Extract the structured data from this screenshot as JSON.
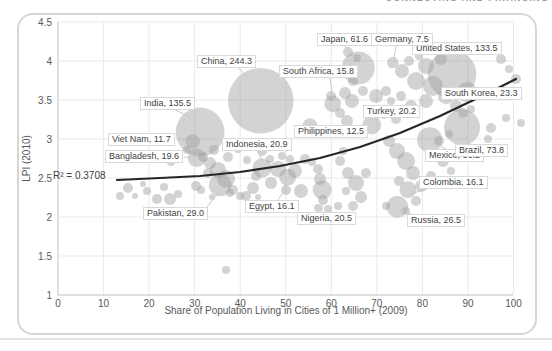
{
  "page": {
    "header_fragment": "CONNECTING AND FINANCING"
  },
  "chart_data": {
    "type": "scatter",
    "bubble": true,
    "title": "",
    "xlabel": "Share of Population Living in Cities of 1 Million+ (2009)",
    "ylabel": "LPI (2010)",
    "xlim": [
      0,
      100
    ],
    "ylim": [
      1,
      4.5
    ],
    "x_ticks": [
      0,
      10,
      20,
      30,
      40,
      50,
      60,
      70,
      80,
      90,
      100
    ],
    "y_ticks": [
      1,
      1.5,
      2,
      2.5,
      3,
      3.5,
      4,
      4.5
    ],
    "grid": true,
    "legend": "none",
    "r2_label": "R² = 0.3708",
    "r_squared": 0.3708,
    "trendline": {
      "type": "exponential",
      "points_px": [
        [
          117,
          180
        ],
        [
          160,
          178
        ],
        [
          200,
          176
        ],
        [
          240,
          172
        ],
        [
          280,
          166
        ],
        [
          320,
          158
        ],
        [
          360,
          147
        ],
        [
          400,
          133
        ],
        [
          440,
          116
        ],
        [
          480,
          97
        ],
        [
          516,
          79
        ]
      ]
    },
    "plot_px": {
      "x0": 58,
      "x_per_unit": 4.555,
      "y_base": 295,
      "px_per_lpi": 78,
      "top": 22,
      "right": 513
    },
    "bubble_scale": 2.1,
    "labeled_points": [
      {
        "name": "India",
        "label": "India, 135.5",
        "size": 135.5,
        "x": 31.2,
        "lpi": 3.09,
        "label_px": [
          140,
          97
        ],
        "leader": [
          [
            172,
            108
          ],
          [
            195,
            120
          ]
        ]
      },
      {
        "name": "China",
        "label": "China, 244.3",
        "size": 244.3,
        "x": 44.5,
        "lpi": 3.49,
        "label_px": [
          197,
          55
        ],
        "leader": [
          [
            238,
            67
          ],
          [
            259,
            90
          ]
        ]
      },
      {
        "name": "Viet Nam",
        "label": "Viet Nam, 11.7",
        "size": 11.7,
        "x": 29.6,
        "lpi": 2.97,
        "label_px": [
          108,
          133
        ],
        "leader": [
          [
            178,
            139
          ],
          [
            189,
            141
          ]
        ]
      },
      {
        "name": "Bangladesh",
        "label": "Bangladesh, 19.6",
        "size": 19.6,
        "x": 30.5,
        "lpi": 2.76,
        "label_px": [
          105,
          150
        ],
        "leader": [
          [
            184,
            157
          ],
          [
            193,
            158
          ]
        ]
      },
      {
        "name": "Indonesia",
        "label": "Indonesia, 20.9",
        "size": 20.9,
        "x": 44.8,
        "lpi": 2.63,
        "label_px": [
          222,
          138
        ],
        "leader": [
          [
            258,
            151
          ],
          [
            262,
            161
          ]
        ]
      },
      {
        "name": "Philippines",
        "label": "Philippines, 12.5",
        "size": 12.5,
        "x": 55.3,
        "lpi": 3.17,
        "label_px": [
          294,
          125
        ],
        "leader": [
          [
            308,
            126
          ],
          [
            311,
            124
          ]
        ]
      },
      {
        "name": "Pakistan",
        "label": "Pakistan, 29.0",
        "size": 29.0,
        "x": 35.6,
        "lpi": 2.41,
        "label_px": [
          143,
          207
        ],
        "leader": [
          [
            207,
            207
          ],
          [
            219,
            192
          ]
        ]
      },
      {
        "name": "Egypt",
        "label": "Egypt, 16.1",
        "size": 16.1,
        "x": 50.4,
        "lpi": 2.51,
        "label_px": [
          245,
          200
        ],
        "leader": [
          [
            278,
            200
          ],
          [
            287,
            186
          ]
        ]
      },
      {
        "name": "Nigeria",
        "label": "Nigeria, 20.5",
        "size": 20.5,
        "x": 58.0,
        "lpi": 2.35,
        "label_px": [
          297,
          212
        ],
        "leader": [
          [
            322,
            212
          ],
          [
            322,
            198
          ]
        ]
      },
      {
        "name": "Russia",
        "label": "Russia, 26.5",
        "size": 26.5,
        "x": 74.5,
        "lpi": 2.13,
        "label_px": [
          407,
          214
        ],
        "leader": [
          [
            411,
            214
          ],
          [
            400,
            210
          ]
        ]
      },
      {
        "name": "Colombia",
        "label": "Colombia, 16.1",
        "size": 16.1,
        "x": 76.8,
        "lpi": 2.35,
        "label_px": [
          419,
          176
        ],
        "leader": [
          [
            430,
            188
          ],
          [
            410,
            194
          ]
        ]
      },
      {
        "name": "Mexico",
        "label": "Mexico, 36.2",
        "size": 36.2,
        "x": 81.6,
        "lpi": 2.99,
        "label_px": [
          425,
          149
        ],
        "leader": [
          [
            446,
            149
          ],
          [
            433,
            143
          ]
        ]
      },
      {
        "name": "Brazil",
        "label": "Brazil, 73.8",
        "size": 73.8,
        "x": 88.7,
        "lpi": 3.15,
        "label_px": [
          455,
          144
        ],
        "leader": [
          [
            470,
            144
          ],
          [
            464,
            134
          ]
        ]
      },
      {
        "name": "Turkey",
        "label": "Turkey, 20.2",
        "size": 20.2,
        "x": 68.9,
        "lpi": 3.18,
        "label_px": [
          363,
          105
        ],
        "leader": [
          [
            377,
            117
          ],
          [
            373,
            122
          ]
        ]
      },
      {
        "name": "South Korea",
        "label": "South Korea, 23.3",
        "size": 23.3,
        "x": 89.8,
        "lpi": 3.6,
        "label_px": [
          441,
          87
        ],
        "leader": [
          [
            460,
            98
          ],
          [
            467,
            94
          ]
        ]
      },
      {
        "name": "South Africa",
        "label": "South Africa, 15.8",
        "size": 15.8,
        "x": 60.3,
        "lpi": 3.45,
        "label_px": [
          279,
          65
        ],
        "leader": [
          [
            330,
            78
          ],
          [
            333,
            99
          ]
        ]
      },
      {
        "name": "Japan",
        "label": "Japan, 61.6",
        "size": 61.6,
        "x": 65.9,
        "lpi": 3.91,
        "label_px": [
          317,
          33
        ],
        "leader": [
          [
            345,
            46
          ],
          [
            355,
            58
          ]
        ]
      },
      {
        "name": "United States",
        "label": "United States, 133.5",
        "size": 133.5,
        "x": 86.5,
        "lpi": 3.83,
        "label_px": [
          412,
          42
        ],
        "leader": [
          [
            460,
            54
          ],
          [
            455,
            64
          ]
        ]
      },
      {
        "name": "Germany",
        "label": "Germany, 7.5",
        "size": 7.5,
        "x": 73.5,
        "lpi": 3.98,
        "label_px": [
          371,
          33
        ],
        "leader": [
          [
            396,
            46
          ],
          [
            394,
            59
          ]
        ]
      }
    ],
    "background_points_px": [
      [
        120,
        196,
        4
      ],
      [
        128,
        188,
        5
      ],
      [
        135,
        196,
        3
      ],
      [
        147,
        191,
        4
      ],
      [
        157,
        199,
        5
      ],
      [
        164,
        187,
        4
      ],
      [
        170,
        199,
        6
      ],
      [
        178,
        194,
        4
      ],
      [
        143,
        184,
        3
      ],
      [
        203,
        157,
        5
      ],
      [
        210,
        163,
        6
      ],
      [
        218,
        170,
        8
      ],
      [
        226,
        179,
        9
      ],
      [
        233,
        190,
        5
      ],
      [
        240,
        196,
        4
      ],
      [
        214,
        150,
        5
      ],
      [
        228,
        157,
        5
      ],
      [
        238,
        149,
        4
      ],
      [
        208,
        173,
        5
      ],
      [
        201,
        190,
        4
      ],
      [
        212,
        197,
        3
      ],
      [
        230,
        193,
        4
      ],
      [
        246,
        196,
        5
      ],
      [
        253,
        188,
        6
      ],
      [
        256,
        176,
        5
      ],
      [
        247,
        160,
        4
      ],
      [
        171,
        162,
        4
      ],
      [
        187,
        150,
        4
      ],
      [
        196,
        186,
        5
      ],
      [
        262,
        151,
        5
      ],
      [
        270,
        159,
        4
      ],
      [
        278,
        169,
        8
      ],
      [
        286,
        190,
        5
      ],
      [
        271,
        183,
        6
      ],
      [
        295,
        171,
        7
      ],
      [
        301,
        191,
        7
      ],
      [
        258,
        197,
        3
      ],
      [
        290,
        159,
        4
      ],
      [
        305,
        159,
        5
      ],
      [
        282,
        156,
        4
      ],
      [
        318,
        169,
        5
      ],
      [
        320,
        179,
        6
      ],
      [
        323,
        200,
        5
      ],
      [
        318,
        208,
        4
      ],
      [
        328,
        209,
        4
      ],
      [
        312,
        162,
        4
      ],
      [
        340,
        161,
        5
      ],
      [
        348,
        173,
        6
      ],
      [
        356,
        183,
        8
      ],
      [
        361,
        197,
        6
      ],
      [
        346,
        191,
        4
      ],
      [
        338,
        206,
        4
      ],
      [
        353,
        206,
        5
      ],
      [
        366,
        173,
        5
      ],
      [
        343,
        151,
        4
      ],
      [
        348,
        52,
        5
      ],
      [
        357,
        58,
        4
      ],
      [
        345,
        93,
        6
      ],
      [
        352,
        101,
        7
      ],
      [
        340,
        113,
        5
      ],
      [
        347,
        121,
        6
      ],
      [
        331,
        96,
        5
      ],
      [
        363,
        91,
        5
      ],
      [
        376,
        96,
        7
      ],
      [
        386,
        91,
        5
      ],
      [
        391,
        101,
        4
      ],
      [
        384,
        113,
        6
      ],
      [
        396,
        119,
        5
      ],
      [
        353,
        81,
        5
      ],
      [
        402,
        71,
        7
      ],
      [
        409,
        61,
        5
      ],
      [
        416,
        81,
        9
      ],
      [
        426,
        66,
        8
      ],
      [
        433,
        86,
        10
      ],
      [
        441,
        59,
        6
      ],
      [
        446,
        96,
        8
      ],
      [
        426,
        101,
        7
      ],
      [
        456,
        106,
        6
      ],
      [
        463,
        113,
        5
      ],
      [
        471,
        109,
        4
      ],
      [
        419,
        56,
        4
      ],
      [
        401,
        96,
        5
      ],
      [
        411,
        106,
        6
      ],
      [
        501,
        59,
        5
      ],
      [
        509,
        69,
        4
      ],
      [
        516,
        79,
        5
      ],
      [
        498,
        91,
        4
      ],
      [
        506,
        118,
        4
      ],
      [
        521,
        123,
        4
      ],
      [
        491,
        128,
        5
      ],
      [
        389,
        141,
        6
      ],
      [
        397,
        151,
        8
      ],
      [
        406,
        161,
        9
      ],
      [
        413,
        173,
        7
      ],
      [
        399,
        181,
        5
      ],
      [
        421,
        186,
        6
      ],
      [
        431,
        176,
        5
      ],
      [
        443,
        161,
        6
      ],
      [
        451,
        171,
        4
      ],
      [
        416,
        201,
        5
      ],
      [
        406,
        211,
        4
      ],
      [
        386,
        206,
        4
      ],
      [
        439,
        141,
        5
      ],
      [
        449,
        134,
        4
      ],
      [
        488,
        139,
        4
      ],
      [
        496,
        151,
        4
      ],
      [
        226,
        270,
        4
      ]
    ]
  },
  "colors": {
    "bubble": "#9e9e9e",
    "bubble_opacity": "0.45",
    "trend": "#262626",
    "grid": "#e9e9e9",
    "axis": "#c0c0c0",
    "tick_text": "#595959",
    "label_text": "#3f3f3f",
    "label_border": "#d9d9d9",
    "leader": "#c9c9c9"
  }
}
